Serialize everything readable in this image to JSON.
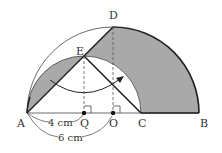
{
  "diagram": {
    "points": {
      "A": "A",
      "B": "B",
      "C": "C",
      "D": "D",
      "E": "E",
      "O": "O",
      "Q": "Q"
    },
    "measurements": {
      "AQ": "4 cm",
      "AO": "6 cm"
    },
    "colors": {
      "shade": "#a9a9a9",
      "line": "#222222"
    }
  }
}
